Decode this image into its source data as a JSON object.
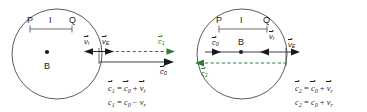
{
  "figure": {
    "colors": {
      "stroke": "#4a4a4a",
      "text": "#1a1a1a",
      "accent_green": "#2e7d32",
      "background": "#ffffff"
    }
  },
  "panels": [
    {
      "id": "left",
      "center_label": "B",
      "scale": {
        "left_label": "P",
        "mid_label": "I",
        "right_label": "Q"
      },
      "vectors": [
        {
          "name": "v_r",
          "label_base": "v",
          "label_sub": "r",
          "direction": "left",
          "color": "#1a1a1a"
        },
        {
          "name": "v_E",
          "label_base": "v",
          "label_sub": "E",
          "direction": "right",
          "color": "#1a1a1a"
        },
        {
          "name": "c_1",
          "label_base": "c",
          "label_sub": "1",
          "direction": "right",
          "color": "#2e7d32"
        },
        {
          "name": "c_0",
          "label_base": "c",
          "label_sub": "0",
          "direction": "right",
          "color": "#1a1a1a"
        }
      ],
      "equations": [
        {
          "lhs_base": "c",
          "lhs_sub": "1",
          "rhs": "= c0 + vr",
          "vector_form": true,
          "text": "c1 = c0 + vr"
        },
        {
          "lhs_base": "c",
          "lhs_sub": "1",
          "rhs": "= c0 - vr",
          "vector_form": false,
          "text": "c1 = c0 - vr"
        }
      ],
      "equation_parts": {
        "eq1": {
          "c_left": "c",
          "s_left": "1",
          "eq": "=",
          "c_a": "c",
          "s_a": "0",
          "op": "+",
          "v": "v",
          "s_b": "r"
        },
        "eq2": {
          "c_left": "c",
          "s_left": "1",
          "eq": "=",
          "c_a": "c",
          "s_a": "0",
          "op": "−",
          "v": "v",
          "s_b": "r"
        }
      }
    },
    {
      "id": "right",
      "center_label": "B",
      "scale": {
        "left_label": "P",
        "mid_label": "I",
        "right_label": "Q"
      },
      "vectors": [
        {
          "name": "c_0",
          "label_base": "c",
          "label_sub": "0",
          "direction": "right",
          "color": "#1a1a1a"
        },
        {
          "name": "v_r",
          "label_base": "v",
          "label_sub": "r",
          "direction": "left",
          "color": "#1a1a1a"
        },
        {
          "name": "v_E",
          "label_base": "v",
          "label_sub": "E",
          "direction": "right",
          "color": "#1a1a1a"
        },
        {
          "name": "c_2",
          "label_base": "c",
          "label_sub": "2",
          "direction": "left",
          "color": "#2e7d32"
        }
      ],
      "equations": [
        {
          "lhs_base": "c",
          "lhs_sub": "2",
          "rhs": "= c0 + vr",
          "vector_form": true,
          "text": "c2 = c0 + vr"
        },
        {
          "lhs_base": "c",
          "lhs_sub": "2",
          "rhs": "= c0 + vr",
          "vector_form": false,
          "text": "c2 = c0 + vr"
        }
      ],
      "equation_parts": {
        "eq1": {
          "c_left": "c",
          "s_left": "2",
          "eq": "=",
          "c_a": "c",
          "s_a": "0",
          "op": "+",
          "v": "v",
          "s_b": "r"
        },
        "eq2": {
          "c_left": "c",
          "s_left": "2",
          "eq": "=",
          "c_a": "c",
          "s_a": "0",
          "op": "+",
          "v": "v",
          "s_b": "r"
        }
      }
    }
  ]
}
